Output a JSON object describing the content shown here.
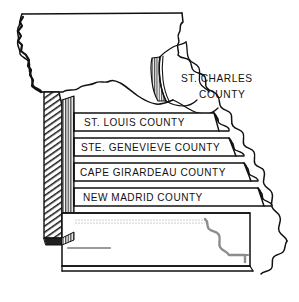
{
  "figure": {
    "type": "map-diagram",
    "style": "pen-and-ink line drawing, exploded 3D block diagram",
    "background_color": "#ffffff",
    "ink_color": "#111111",
    "shadow_color": "#3a3a3a",
    "light_hatch_color": "#9a9a9a"
  },
  "labels": {
    "st_charles_line1": "ST. CHARLES",
    "st_charles_line2": "COUNTY",
    "bands": [
      {
        "id": "st-louis",
        "text": "ST. LOUIS COUNTY"
      },
      {
        "id": "ste-genevieve",
        "text": "STE. GENEVIEVE COUNTY"
      },
      {
        "id": "cape-girardeau",
        "text": "CAPE GIRARDEAU COUNTY"
      },
      {
        "id": "new-madrid",
        "text": "NEW MADRID COUNTY"
      }
    ]
  }
}
